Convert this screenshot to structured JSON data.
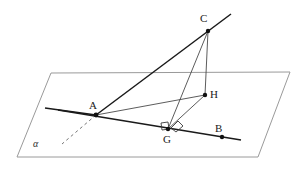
{
  "figure": {
    "width": 302,
    "height": 169,
    "background_color": "#ffffff",
    "stroke_color": "#1a1a1a",
    "thin_stroke_color": "#555555",
    "plane_stroke_color": "#9a9a9a",
    "dashed_stroke_color": "#777777"
  },
  "plane": {
    "name": "alpha",
    "label": "α",
    "label_position": {
      "x": 33,
      "y": 139
    },
    "corners": [
      {
        "x": 51,
        "y": 73
      },
      {
        "x": 290,
        "y": 72
      },
      {
        "x": 258,
        "y": 157
      },
      {
        "x": 17,
        "y": 157
      }
    ]
  },
  "points": [
    {
      "id": "C",
      "label": "C",
      "x": 208,
      "y": 31,
      "label_x": 200,
      "label_y": 13,
      "dot": true
    },
    {
      "id": "H",
      "label": "H",
      "x": 205,
      "y": 95,
      "label_x": 210,
      "label_y": 89,
      "dot": true
    },
    {
      "id": "A",
      "label": "A",
      "x": 96,
      "y": 115,
      "label_x": 89,
      "label_y": 100,
      "dot": true
    },
    {
      "id": "G",
      "label": "G",
      "x": 168,
      "y": 129,
      "label_x": 163,
      "label_y": 134,
      "dot": true
    },
    {
      "id": "B",
      "label": "B",
      "x": 222,
      "y": 137,
      "label_x": 215,
      "label_y": 123,
      "dot": true
    }
  ],
  "segments": [
    {
      "id": "line-AC-extended",
      "from": {
        "x": 96,
        "y": 115
      },
      "to": {
        "x": 231,
        "y": 14
      },
      "style": "thick-solid"
    },
    {
      "id": "line-AB-extended",
      "from": {
        "x": 58,
        "y": 110
      },
      "to": {
        "x": 241,
        "y": 140
      },
      "style": "thick-solid"
    },
    {
      "id": "line-through-A-left",
      "from": {
        "x": 45,
        "y": 108
      },
      "to": {
        "x": 96,
        "y": 115
      },
      "style": "thick-solid"
    },
    {
      "id": "dashed-ray-from-A",
      "from": {
        "x": 96,
        "y": 115
      },
      "to": {
        "x": 62,
        "y": 144
      },
      "style": "dashed"
    },
    {
      "id": "segment-CG",
      "from": {
        "x": 208,
        "y": 31
      },
      "to": {
        "x": 168,
        "y": 129
      },
      "style": "thin-solid"
    },
    {
      "id": "segment-CH",
      "from": {
        "x": 208,
        "y": 31
      },
      "to": {
        "x": 205,
        "y": 95
      },
      "style": "thin-solid"
    },
    {
      "id": "segment-AH",
      "from": {
        "x": 96,
        "y": 115
      },
      "to": {
        "x": 205,
        "y": 95
      },
      "style": "thin-solid"
    },
    {
      "id": "segment-GH",
      "from": {
        "x": 168,
        "y": 129
      },
      "to": {
        "x": 205,
        "y": 95
      },
      "style": "thin-solid"
    }
  ],
  "right_angle_marks": [
    {
      "id": "right-angle-at-G-left",
      "points": "161,123 168,122 169,129 162,130"
    },
    {
      "id": "right-angle-at-G-right",
      "points": "171,128 178,121 183,126 176,132"
    }
  ]
}
